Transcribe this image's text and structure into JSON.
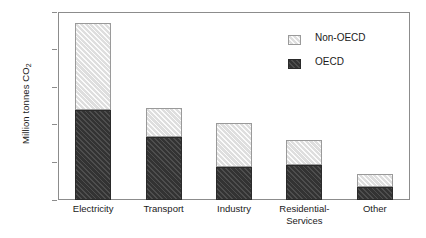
{
  "chart_data": {
    "type": "bar",
    "subtype": "stacked",
    "title": "",
    "xlabel": "",
    "ylabel": "Million tonnes CO",
    "ylabel_sub": "2",
    "categories": [
      "Electricity",
      "Transport",
      "Industry",
      "Residential-\nServices",
      "Other"
    ],
    "series": [
      {
        "name": "OECD",
        "color": "#3a3a3a",
        "values": [
          4800,
          3350,
          1750,
          1850,
          700
        ]
      },
      {
        "name": "Non-OECD",
        "color": "#e6e6e6",
        "values": [
          4600,
          1550,
          2350,
          1350,
          700
        ]
      }
    ],
    "totals": [
      9400,
      4900,
      4100,
      3200,
      1400
    ],
    "stack_order": [
      "OECD",
      "Non-OECD"
    ],
    "ylim": [
      0,
      10000
    ],
    "yticks": [
      0,
      2000,
      4000,
      6000,
      8000,
      10000
    ],
    "ytick_labels": [
      "0",
      "2000",
      "4000",
      "6000",
      "8000",
      "10000"
    ],
    "grid": false,
    "legend_position": "upper-right-inside",
    "legend_entries": [
      "Non-OECD",
      "OECD"
    ],
    "frame": true,
    "axis_color": "#8c8c8c"
  }
}
